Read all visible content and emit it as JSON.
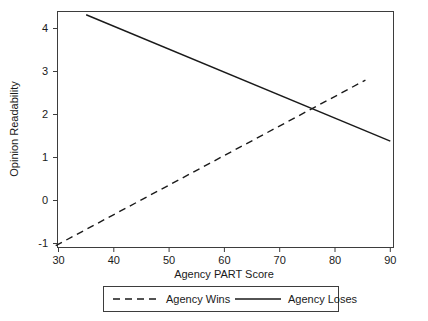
{
  "chart_data": {
    "type": "line",
    "title": "",
    "xlabel": "Agency PART Score",
    "ylabel": "Opinion Readability",
    "xlim": [
      29,
      91
    ],
    "ylim": [
      -1.35,
      4.65
    ],
    "xticks": [
      30,
      40,
      50,
      60,
      70,
      80,
      90
    ],
    "xtick_labels": [
      "30",
      "40",
      "50",
      "60",
      "70",
      "80",
      "90"
    ],
    "yticks": [
      -1,
      0,
      1,
      2,
      3,
      4
    ],
    "ytick_labels": [
      "-1",
      "0",
      "1",
      "2",
      "3",
      "4"
    ],
    "grid": false,
    "legend_position": "below-axes",
    "series": [
      {
        "name": "Agency Wins",
        "style": "dashed",
        "color": "#1a1a1a",
        "x": [
          29.5,
          85.5
        ],
        "y": [
          -1.05,
          2.8
        ]
      },
      {
        "name": "Agency Loses",
        "style": "solid",
        "color": "#1a1a1a",
        "x": [
          35,
          90
        ],
        "y": [
          4.32,
          1.38
        ]
      }
    ]
  },
  "axes": {
    "x_title": "Agency PART Score",
    "y_title": "Opinion Readability",
    "x_tick_labels": [
      "30",
      "40",
      "50",
      "60",
      "70",
      "80",
      "90"
    ],
    "y_tick_labels": [
      "4",
      "3",
      "2",
      "1",
      "0",
      "-1"
    ]
  },
  "legend": {
    "entries": [
      {
        "label": "Agency Wins",
        "style": "dashed"
      },
      {
        "label": "Agency Loses",
        "style": "solid"
      }
    ]
  },
  "colors": {
    "line": "#1a1a1a",
    "axis": "#3d3d3d",
    "background": "#ffffff"
  }
}
